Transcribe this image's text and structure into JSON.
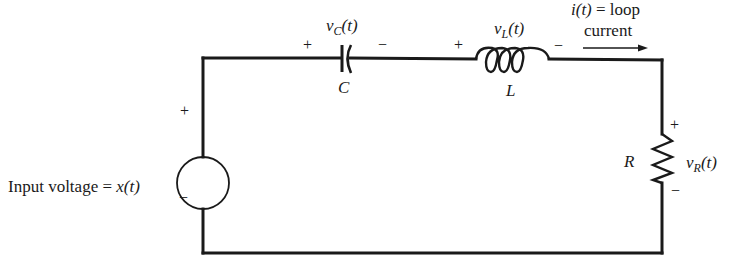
{
  "diagram": {
    "type": "series RLC circuit",
    "source": {
      "label": "Input voltage = x(t)",
      "label_prefix": "Input voltage = ",
      "label_var": "x(t)",
      "plus": "+",
      "minus": "−"
    },
    "capacitor": {
      "voltage_label": "v",
      "voltage_sub": "C",
      "voltage_suffix": "(t)",
      "name": "C",
      "plus": "+",
      "minus": "−"
    },
    "inductor": {
      "voltage_label": "v",
      "voltage_sub": "L",
      "voltage_suffix": "(t)",
      "name": "L",
      "plus": "+",
      "minus": "−"
    },
    "resistor": {
      "voltage_label": "v",
      "voltage_sub": "R",
      "voltage_suffix": "(t)",
      "name": "R",
      "plus": "+",
      "minus": "−"
    },
    "current": {
      "line1": "i(t) = loop",
      "line1_var": "i(t)",
      "line1_rest": " = loop",
      "line2": "current"
    },
    "colors": {
      "ink": "#1a1a1a",
      "background": "#ffffff"
    }
  }
}
